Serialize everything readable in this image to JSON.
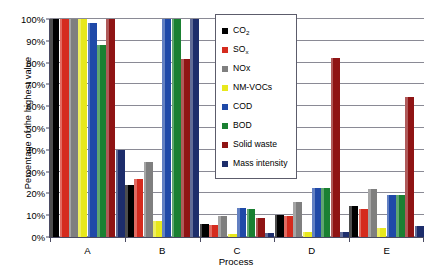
{
  "chart_data": {
    "type": "bar",
    "title": "",
    "xlabel": "Process",
    "ylabel": "Percentage of the highest value",
    "categories": [
      "A",
      "B",
      "C",
      "D",
      "E"
    ],
    "ylim": [
      0,
      100
    ],
    "ytick_labels": [
      "0%",
      "10%",
      "20%",
      "30%",
      "40%",
      "50%",
      "60%",
      "70%",
      "80%",
      "90%",
      "100%"
    ],
    "ytick_values": [
      0,
      10,
      20,
      30,
      40,
      50,
      60,
      70,
      80,
      90,
      100
    ],
    "grid": true,
    "legend_position": "inside-top-center",
    "series": [
      {
        "name": "CO₂",
        "label_html": "CO<sub>2</sub>",
        "color": "#000000",
        "values": [
          100,
          24,
          6,
          10,
          14
        ]
      },
      {
        "name": "SOₓ",
        "label_html": "SO<sub>x</sub>",
        "color": "#d52b1e",
        "values": [
          100,
          26.5,
          5.5,
          9.5,
          13
        ]
      },
      {
        "name": "NOx",
        "label_html": "NOx",
        "color": "#7f7f7f",
        "values": [
          100,
          34.5,
          9.5,
          16,
          22
        ]
      },
      {
        "name": "NM-VOCs",
        "label_html": "NM-VOCs",
        "color": "#e8e81c",
        "values": [
          100,
          7.5,
          1.5,
          2.5,
          4
        ]
      },
      {
        "name": "COD",
        "label_html": "COD",
        "color": "#1f49a8",
        "values": [
          98,
          100,
          13.5,
          22.5,
          19.5
        ]
      },
      {
        "name": "BOD",
        "label_html": "BOD",
        "color": "#1a8032",
        "values": [
          88,
          100,
          13,
          22.5,
          19.5
        ]
      },
      {
        "name": "Solid waste",
        "label_html": "Solid waste",
        "color": "#8f1414",
        "values": [
          100,
          81.5,
          8.5,
          82,
          64
        ]
      },
      {
        "name": "Mass intensity",
        "label_html": "Mass intensity",
        "color": "#1d2d6b",
        "values": [
          40,
          100,
          2,
          2.5,
          5
        ]
      }
    ]
  }
}
